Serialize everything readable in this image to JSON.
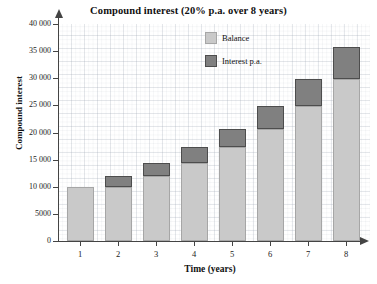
{
  "chart_data": {
    "type": "bar",
    "title": "Compound interest (20% p.a. over 8 years)",
    "xlabel": "Time (years)",
    "ylabel": "Compound interest",
    "categories": [
      "1",
      "2",
      "3",
      "4",
      "5",
      "6",
      "7",
      "8"
    ],
    "ylim": [
      0,
      40000
    ],
    "ytick_labels": [
      "0",
      "5000",
      "10 000",
      "15 000",
      "20 000",
      "25 000",
      "30 000",
      "35 000",
      "40 000"
    ],
    "ytick_values": [
      0,
      5000,
      10000,
      15000,
      20000,
      25000,
      30000,
      35000,
      40000
    ],
    "grid": true,
    "stacked": true,
    "legend_position": "top-right",
    "series": [
      {
        "name": "Balance",
        "color": "#c9c9c9",
        "values": [
          10000,
          10000,
          12000,
          14400,
          17280,
          20736,
          24883,
          29860
        ]
      },
      {
        "name": "Interest p.a.",
        "color": "#808080",
        "values": [
          0,
          2000,
          2400,
          2880,
          3456,
          4147,
          4977,
          5972
        ]
      }
    ],
    "totals": [
      10000,
      12000,
      14400,
      17280,
      20736,
      24883,
      29860,
      35832
    ]
  },
  "legend": {
    "items": [
      {
        "label": "Balance"
      },
      {
        "label": "Interest p.a."
      }
    ]
  }
}
